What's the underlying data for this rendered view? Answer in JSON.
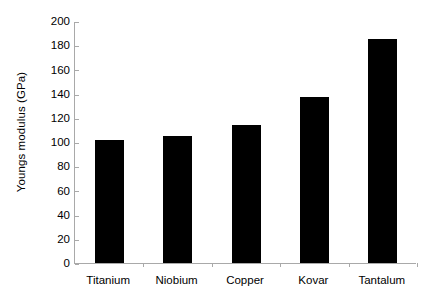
{
  "chart_data": {
    "type": "bar",
    "title": "",
    "subtitle": "",
    "xlabel": "",
    "ylabel": "Youngs modulus (GPa)",
    "categories": [
      "Titanium",
      "Niobium",
      "Copper",
      "Kovar",
      "Tantalum"
    ],
    "values": [
      102,
      105,
      114,
      137,
      185
    ],
    "series": [
      {
        "name": "Youngs modulus",
        "values": [
          102,
          105,
          114,
          137,
          185
        ]
      }
    ],
    "ylim": [
      0,
      200
    ],
    "ytick_step": 20,
    "yticks": [
      0,
      20,
      40,
      60,
      80,
      100,
      120,
      140,
      160,
      180,
      200
    ],
    "ytick_labels": [
      "0",
      "20",
      "40",
      "60",
      "80",
      "100",
      "120",
      "140",
      "160",
      "180",
      "200"
    ],
    "xtick_labels": [
      "Titanium",
      "Niobium",
      "Copper",
      "Kovar",
      "Tantalum"
    ],
    "grid": false,
    "legend": false,
    "legend_position": "none",
    "bar_color": "#000000",
    "axis_color": "#a9a9a9",
    "background_color": "#ffffff",
    "annotations": []
  }
}
